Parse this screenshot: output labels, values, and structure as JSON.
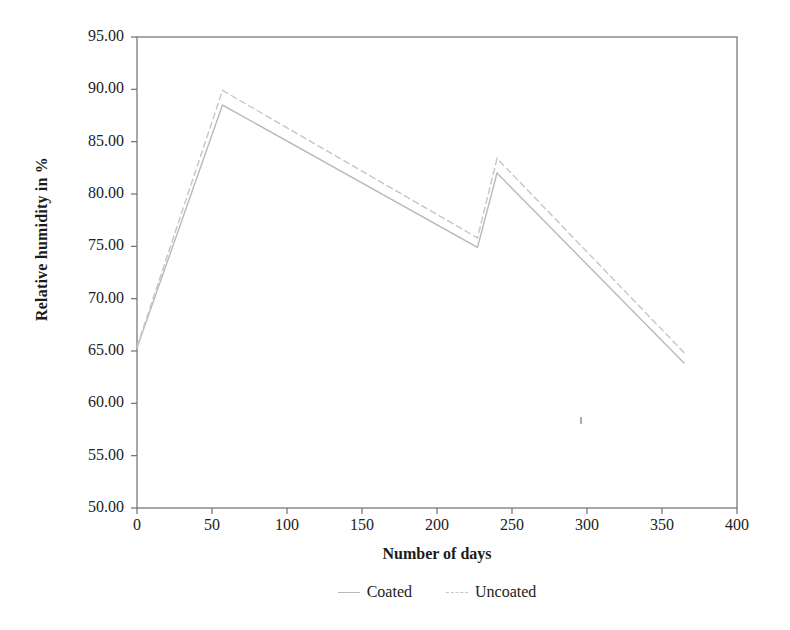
{
  "chart_data": {
    "type": "line",
    "title": "",
    "xlabel": "Number of days",
    "ylabel": "Relative humidity in %",
    "xlim": [
      0,
      400
    ],
    "ylim": [
      50.0,
      95.0
    ],
    "grid": false,
    "legend_position": "bottom",
    "xticks": [
      "0",
      "50",
      "100",
      "150",
      "200",
      "250",
      "300",
      "350",
      "400"
    ],
    "xtick_values": [
      0,
      50,
      100,
      150,
      200,
      250,
      300,
      350,
      400
    ],
    "yticks": [
      "50.00",
      "55.00",
      "60.00",
      "65.00",
      "70.00",
      "75.00",
      "80.00",
      "85.00",
      "90.00",
      "95.00"
    ],
    "ytick_values": [
      50.0,
      55.0,
      60.0,
      65.0,
      70.0,
      75.0,
      80.0,
      85.0,
      90.0,
      95.0
    ],
    "x": [
      0,
      57,
      227,
      240,
      365
    ],
    "series": [
      {
        "name": "Coated",
        "color": "#b9b9b9",
        "style": "solid",
        "values": [
          65.3,
          88.5,
          74.9,
          82.0,
          63.8
        ]
      },
      {
        "name": "Uncoated",
        "color": "#c6c6c6",
        "style": "dashed",
        "values": [
          65.4,
          89.9,
          75.8,
          83.4,
          64.8
        ]
      }
    ]
  },
  "legend": {
    "items": [
      {
        "label": "Coated"
      },
      {
        "label": "Uncoated"
      }
    ]
  }
}
